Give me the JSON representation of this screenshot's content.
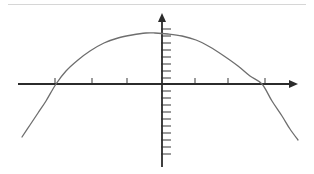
{
  "figure": {
    "title": "",
    "caption": "",
    "background_color": "#ffffff"
  },
  "top_rule": {
    "name": "horizontal-divider-rule",
    "x1": 8,
    "y1": 4.5,
    "x2": 306,
    "y2": 4.5,
    "color": "#d6d6d6",
    "width": 1.2
  },
  "axes": {
    "color": "#2b2b2b",
    "line_width": 1.8,
    "origin": {
      "x": 162,
      "y": 84
    },
    "x_axis": {
      "name": "x-axis",
      "label": "",
      "start_x": 18,
      "end_x": 290,
      "y": 84,
      "arrow": {
        "tip_x": 298,
        "half_height": 4,
        "length": 9
      },
      "tick_length_up": 6,
      "tick_length_down": 0,
      "tick_color": "#4a4a4a",
      "tick_width": 1.1,
      "tick_positions_px": [
        55,
        92,
        127,
        195,
        228,
        265
      ],
      "tick_labels": [
        "",
        "",
        "",
        "",
        "",
        ""
      ]
    },
    "y_axis": {
      "name": "y-axis",
      "label": "",
      "top_y": 20,
      "bottom_y": 167,
      "x": 162,
      "arrow": {
        "tip_y": 13,
        "half_width": 4,
        "length": 9
      },
      "tick_length_right": 9,
      "tick_color": "#4a4a4a",
      "tick_width": 1.1,
      "tick_positions_px": [
        29,
        36,
        43,
        50,
        57,
        64,
        71,
        78,
        91,
        98,
        105,
        112,
        119,
        126,
        133,
        140,
        147,
        154
      ],
      "tick_labels": []
    }
  },
  "chart_data": {
    "type": "line",
    "title": "",
    "subtitle": "",
    "xlabel": "",
    "ylabel": "",
    "grid": false,
    "legend": null,
    "legend_position": "none",
    "curve": {
      "name": "downward-parabola",
      "shape": "parabola opening downward",
      "color": "#6e6e6e",
      "line_width": 1.3,
      "vertex_px": {
        "x": 155,
        "y": 33
      },
      "x_intercepts_px": [
        56,
        262
      ],
      "endpoints_px": [
        {
          "x": 22,
          "y": 137
        },
        {
          "x": 298,
          "y": 140
        }
      ],
      "points_px": [
        {
          "x": 22,
          "y": 137
        },
        {
          "x": 30,
          "y": 125
        },
        {
          "x": 38,
          "y": 113
        },
        {
          "x": 46,
          "y": 101
        },
        {
          "x": 56,
          "y": 84
        },
        {
          "x": 66,
          "y": 71
        },
        {
          "x": 78,
          "y": 60
        },
        {
          "x": 90,
          "y": 51
        },
        {
          "x": 104,
          "y": 43
        },
        {
          "x": 118,
          "y": 38
        },
        {
          "x": 132,
          "y": 35
        },
        {
          "x": 146,
          "y": 33
        },
        {
          "x": 155,
          "y": 33
        },
        {
          "x": 168,
          "y": 34
        },
        {
          "x": 182,
          "y": 36
        },
        {
          "x": 196,
          "y": 40
        },
        {
          "x": 210,
          "y": 47
        },
        {
          "x": 224,
          "y": 56
        },
        {
          "x": 238,
          "y": 66
        },
        {
          "x": 250,
          "y": 76
        },
        {
          "x": 262,
          "y": 84
        },
        {
          "x": 272,
          "y": 101
        },
        {
          "x": 282,
          "y": 116
        },
        {
          "x": 290,
          "y": 129
        },
        {
          "x": 298,
          "y": 140
        }
      ]
    },
    "x_ticks_px": [
      55,
      92,
      127,
      195,
      228,
      265
    ],
    "y_ticks_px": [
      29,
      36,
      43,
      50,
      57,
      64,
      71,
      78,
      91,
      98,
      105,
      112,
      119,
      126,
      133,
      140,
      147,
      154
    ],
    "xlim_px": [
      18,
      298
    ],
    "ylim_px": [
      13,
      167
    ]
  }
}
